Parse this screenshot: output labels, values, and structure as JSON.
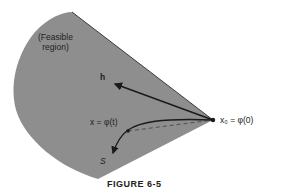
{
  "figure": {
    "caption": "FIGURE 6-5",
    "region_label_line1": "(Feasible",
    "region_label_line2": "region)",
    "h_label": "h",
    "x_label": "x = φ(t)",
    "x0_label": "x₀ = φ(0)",
    "s_label": "S"
  },
  "colors": {
    "region_fill": "#8e8e8e",
    "lines": "#1a1a1a",
    "background": "#ffffff"
  }
}
